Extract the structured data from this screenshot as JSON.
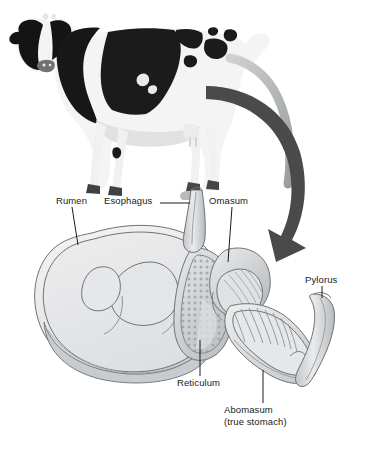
{
  "figure": {
    "kind": "anatomical-diagram",
    "background_color": "#ffffff"
  },
  "photo": {
    "name": "holstein-cow-photo",
    "description": "Black and white Holstein dairy cow standing, side view facing left",
    "colors": {
      "hide_black": "#121212",
      "hide_white": "#f4f4f4",
      "shadow": "#b9bcbe"
    }
  },
  "flow_arrow": {
    "name": "pointer-arrow",
    "description": "Large curved arrow sweeping from the cow down to the stomach diagram",
    "color": "#4a4a4a"
  },
  "colors": {
    "organ_fill_light": "#ededee",
    "organ_fill_mid": "#d6d8d9",
    "organ_fill_dark": "#b5b8ba",
    "organ_outline": "#6e7275",
    "leader_line": "#1c1c1c",
    "label_text": "#1a1a1a"
  },
  "labels": [
    {
      "id": "rumen",
      "text": "Rumen",
      "x": 56,
      "y": 200,
      "organ": "rumen"
    },
    {
      "id": "esophagus",
      "text": "Esophagus",
      "x": 110,
      "y": 200,
      "organ": "esophagus"
    },
    {
      "id": "omasum",
      "text": "Omasum",
      "x": 212,
      "y": 200,
      "organ": "omasum"
    },
    {
      "id": "pylorus",
      "text": "Pylorus",
      "x": 312,
      "y": 279,
      "organ": "pylorus"
    },
    {
      "id": "reticulum",
      "text": "Reticulum",
      "x": 181,
      "y": 381,
      "organ": "reticulum"
    },
    {
      "id": "abomasum",
      "text": "Abomasum",
      "x": 228,
      "y": 409,
      "organ": "abomasum"
    },
    {
      "id": "abomasum2",
      "text": "(true stomach)",
      "x": 228,
      "y": 420,
      "organ": "abomasum"
    }
  ],
  "organs": [
    {
      "id": "rumen",
      "label": "Rumen",
      "note": "Largest chamber, left sac with internal folds"
    },
    {
      "id": "reticulum",
      "label": "Reticulum",
      "note": "Honeycomb-textured pouch below the esophagus"
    },
    {
      "id": "omasum",
      "label": "Omasum",
      "note": "Round chamber with many internal leaves"
    },
    {
      "id": "abomasum",
      "label": "Abomasum",
      "note": "True stomach, J-shaped with rugae folds"
    },
    {
      "id": "esophagus",
      "label": "Esophagus",
      "note": "Tube entering from above"
    },
    {
      "id": "pylorus",
      "label": "Pylorus",
      "note": "Outlet tube leading to the small intestine"
    }
  ]
}
